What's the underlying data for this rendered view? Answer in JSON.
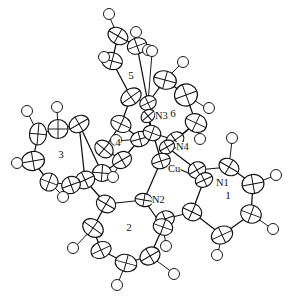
{
  "figure": {
    "kind": "ortep-thermal-ellipsoid-plot",
    "background_color": "#ffffff",
    "line_color": "#111111",
    "width": 296,
    "height": 303
  },
  "atom_labels": [
    {
      "id": "cu",
      "text": "Cu",
      "x": 168,
      "y": 172
    },
    {
      "id": "n1",
      "text": "N1",
      "x": 216,
      "y": 186
    },
    {
      "id": "n2",
      "text": "N2",
      "x": 152,
      "y": 203
    },
    {
      "id": "n3",
      "text": "N3",
      "x": 155,
      "y": 119
    },
    {
      "id": "n4",
      "text": "N4",
      "x": 176,
      "y": 150
    }
  ],
  "ring_labels": [
    {
      "id": "ring1",
      "text": "1",
      "x": 228,
      "y": 199
    },
    {
      "id": "ring2",
      "text": "2",
      "x": 129,
      "y": 231
    },
    {
      "id": "ring3",
      "text": "3",
      "x": 61,
      "y": 158
    },
    {
      "id": "ring4",
      "text": "4",
      "x": 118,
      "y": 146
    },
    {
      "id": "ring5",
      "text": "5",
      "x": 131,
      "y": 79
    },
    {
      "id": "ring6",
      "text": "6",
      "x": 173,
      "y": 117
    }
  ],
  "metal_center": {
    "element": "Cu",
    "x": 161,
    "y": 161,
    "rx": 9.5,
    "ry": 7.5,
    "rot": -18
  },
  "nitrogen_atoms": [
    {
      "name": "N1",
      "x": 204,
      "y": 180,
      "rx": 9.0,
      "ry": 7.0,
      "rot": -25
    },
    {
      "name": "N2",
      "x": 144,
      "y": 200,
      "rx": 9.0,
      "ry": 6.5,
      "rot": 10
    },
    {
      "name": "N3",
      "x": 148,
      "y": 116,
      "rx": 7.5,
      "ry": 6.0,
      "rot": -40
    },
    {
      "name": "N4",
      "x": 167,
      "y": 147,
      "rx": 8.0,
      "ry": 6.5,
      "rot": -30
    }
  ],
  "carbon_ellipsoids": [
    {
      "x": 118,
      "y": 36,
      "rx": 10.5,
      "ry": 8.0,
      "rot": 30
    },
    {
      "x": 137,
      "y": 46,
      "rx": 10.0,
      "ry": 8.0,
      "rot": -20
    },
    {
      "x": 112,
      "y": 61,
      "rx": 10.5,
      "ry": 8.5,
      "rot": 15
    },
    {
      "x": 131,
      "y": 97,
      "rx": 11.0,
      "ry": 8.0,
      "rot": -35
    },
    {
      "x": 121,
      "y": 124,
      "rx": 10.5,
      "ry": 8.0,
      "rot": 25
    },
    {
      "x": 140,
      "y": 139,
      "rx": 9.5,
      "ry": 7.5,
      "rot": -15
    },
    {
      "x": 104,
      "y": 149,
      "rx": 10.0,
      "ry": 8.0,
      "rot": 40
    },
    {
      "x": 122,
      "y": 160,
      "rx": 10.0,
      "ry": 8.0,
      "rot": -30
    },
    {
      "x": 102,
      "y": 173,
      "rx": 9.5,
      "ry": 8.5,
      "rot": 5
    },
    {
      "x": 85,
      "y": 180,
      "rx": 10.0,
      "ry": 8.5,
      "rot": -25
    },
    {
      "x": 58,
      "y": 129,
      "rx": 10.0,
      "ry": 9.5,
      "rot": 0
    },
    {
      "x": 38,
      "y": 134,
      "rx": 8.5,
      "ry": 11.0,
      "rot": 5
    },
    {
      "x": 33,
      "y": 161,
      "rx": 11.5,
      "ry": 9.5,
      "rot": -10
    },
    {
      "x": 49,
      "y": 182,
      "rx": 9.0,
      "ry": 9.0,
      "rot": 20
    },
    {
      "x": 71,
      "y": 185,
      "rx": 9.5,
      "ry": 8.5,
      "rot": -20
    },
    {
      "x": 79,
      "y": 124,
      "rx": 10.5,
      "ry": 8.0,
      "rot": -30
    },
    {
      "x": 106,
      "y": 204,
      "rx": 10.0,
      "ry": 8.5,
      "rot": 30
    },
    {
      "x": 93,
      "y": 228,
      "rx": 11.0,
      "ry": 8.5,
      "rot": 35
    },
    {
      "x": 101,
      "y": 250,
      "rx": 10.5,
      "ry": 8.0,
      "rot": -25
    },
    {
      "x": 126,
      "y": 263,
      "rx": 11.0,
      "ry": 8.5,
      "rot": 15
    },
    {
      "x": 150,
      "y": 256,
      "rx": 10.5,
      "ry": 8.5,
      "rot": -30
    },
    {
      "x": 163,
      "y": 227,
      "rx": 10.0,
      "ry": 8.0,
      "rot": 20
    },
    {
      "x": 165,
      "y": 219,
      "rx": 9.5,
      "ry": 8.0,
      "rot": -20
    },
    {
      "x": 192,
      "y": 212,
      "rx": 10.0,
      "ry": 8.5,
      "rot": 25
    },
    {
      "x": 197,
      "y": 170,
      "rx": 9.0,
      "ry": 8.0,
      "rot": -30
    },
    {
      "x": 229,
      "y": 167,
      "rx": 10.5,
      "ry": 8.0,
      "rot": 30
    },
    {
      "x": 253,
      "y": 184,
      "rx": 11.0,
      "ry": 9.5,
      "rot": -10
    },
    {
      "x": 251,
      "y": 214,
      "rx": 10.5,
      "ry": 9.0,
      "rot": 20
    },
    {
      "x": 222,
      "y": 235,
      "rx": 11.0,
      "ry": 8.5,
      "rot": -25
    },
    {
      "x": 165,
      "y": 80,
      "rx": 11.5,
      "ry": 9.0,
      "rot": 15
    },
    {
      "x": 186,
      "y": 95,
      "rx": 11.5,
      "ry": 11.0,
      "rot": -20
    },
    {
      "x": 196,
      "y": 123,
      "rx": 11.0,
      "ry": 9.0,
      "rot": 25
    },
    {
      "x": 175,
      "y": 140,
      "rx": 9.5,
      "ry": 7.5,
      "rot": -35
    },
    {
      "x": 152,
      "y": 133,
      "rx": 9.0,
      "ry": 7.5,
      "rot": 20
    },
    {
      "x": 148,
      "y": 103,
      "rx": 8.5,
      "ry": 7.0,
      "rot": -25
    }
  ],
  "hydrogen_atoms": [
    {
      "x": 109,
      "y": 14
    },
    {
      "x": 136,
      "y": 32
    },
    {
      "x": 104,
      "y": 57
    },
    {
      "x": 148,
      "y": 50
    },
    {
      "x": 27,
      "y": 111
    },
    {
      "x": 57,
      "y": 107
    },
    {
      "x": 17,
      "y": 163
    },
    {
      "x": 63,
      "y": 197
    },
    {
      "x": 116,
      "y": 140
    },
    {
      "x": 113,
      "y": 177
    },
    {
      "x": 73,
      "y": 248
    },
    {
      "x": 117,
      "y": 285
    },
    {
      "x": 174,
      "y": 274
    },
    {
      "x": 166,
      "y": 246
    },
    {
      "x": 232,
      "y": 138
    },
    {
      "x": 276,
      "y": 175
    },
    {
      "x": 273,
      "y": 229
    },
    {
      "x": 217,
      "y": 255
    },
    {
      "x": 200,
      "y": 139
    },
    {
      "x": 209,
      "y": 108
    },
    {
      "x": 183,
      "y": 62
    },
    {
      "x": 152,
      "y": 51
    }
  ]
}
